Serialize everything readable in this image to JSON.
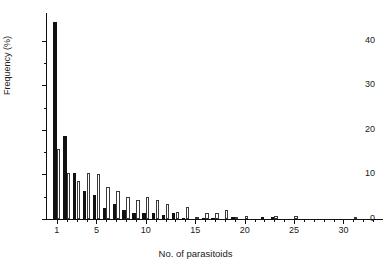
{
  "chart_data": {
    "type": "bar",
    "title": "",
    "subtitle": "",
    "xlabel": "No. of parasitoids",
    "ylabel": "Frequency (%)",
    "xlim": [
      0,
      34
    ],
    "ylim": [
      0,
      46
    ],
    "grid": false,
    "legend_position": "none",
    "x_major_ticks": [
      1,
      5,
      10,
      15,
      20,
      25,
      30
    ],
    "x_major_tick_labels": [
      "1",
      "5",
      "10",
      "15",
      "20",
      "25",
      "30"
    ],
    "x_minor_ticks": [
      2,
      3,
      4,
      6,
      7,
      8,
      9,
      11,
      12,
      13,
      14,
      16,
      17,
      18,
      19,
      21,
      22,
      23,
      24,
      26,
      27,
      28,
      29,
      31,
      32,
      33
    ],
    "y_major_ticks": [
      0,
      10,
      20,
      30,
      40
    ],
    "y_major_tick_labels": [
      "0",
      "10",
      "20",
      "30",
      "40"
    ],
    "y_minor_ticks": [
      5,
      15,
      25,
      35
    ],
    "categories": [
      1,
      2,
      3,
      4,
      5,
      6,
      7,
      8,
      9,
      10,
      11,
      12,
      13,
      14,
      15,
      16,
      17,
      18,
      19,
      20,
      21,
      22,
      23,
      24,
      25,
      26,
      27,
      28,
      29,
      30,
      31,
      32,
      33
    ],
    "series": [
      {
        "name": "observed",
        "color": "#111111",
        "fill": "solid-black",
        "values": [
          44.1,
          18.6,
          10.3,
          6.2,
          5.5,
          2.4,
          3.4,
          2.1,
          1.4,
          1.4,
          1.4,
          1.0,
          1.4,
          0.3,
          0.0,
          0.2,
          0.2,
          0.0,
          0.5,
          0.0,
          0.0,
          0.4,
          0.4,
          0.0,
          0.0,
          0.0,
          0.0,
          0.0,
          0.0,
          0.0,
          0.0,
          0.0,
          0.0
        ]
      },
      {
        "name": "expected",
        "color": "#ffffff",
        "fill": "white-outlined",
        "values": [
          15.7,
          10.3,
          8.6,
          10.3,
          10.0,
          7.1,
          6.2,
          5.0,
          4.3,
          5.0,
          4.3,
          3.4,
          1.5,
          2.6,
          0.4,
          1.4,
          1.4,
          2.1,
          0.5,
          0.7,
          0.0,
          0.0,
          0.6,
          0.0,
          0.7,
          0.0,
          0.0,
          0.0,
          0.0,
          0.0,
          0.2,
          0.0,
          0.0
        ]
      }
    ]
  },
  "axes": {
    "y_title": "Frequency (%)",
    "x_title": "No. of parasitoids"
  }
}
